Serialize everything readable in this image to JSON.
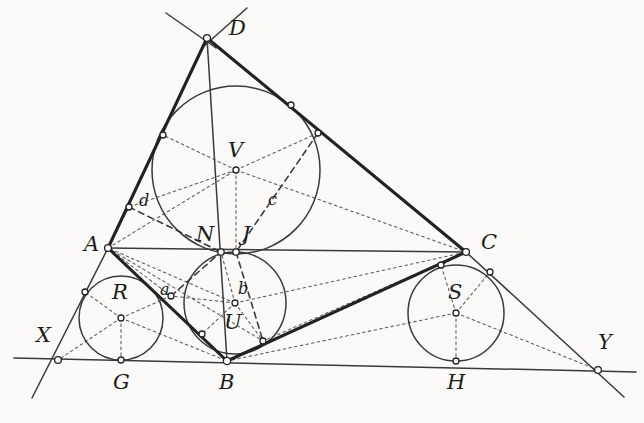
{
  "figure": {
    "kind": "euclidean-geometry-diagram",
    "background_color": "#fbfaf8",
    "stroke_color": "#2b2b2b",
    "solid_line_color": "#3a3a3a",
    "heavy_line_color": "#262626",
    "dashed_line_color": "#555555",
    "node_fill": "#ffffff",
    "canvas": {
      "width": 644,
      "height": 423
    }
  },
  "labels": {
    "capitals": [
      {
        "id": "D",
        "text": "D",
        "x": 229,
        "y": 18
      },
      {
        "id": "V",
        "text": "V",
        "x": 228,
        "y": 140
      },
      {
        "id": "A",
        "text": "A",
        "x": 84,
        "y": 234
      },
      {
        "id": "C",
        "text": "C",
        "x": 481,
        "y": 232
      },
      {
        "id": "N",
        "text": "N",
        "x": 196,
        "y": 224
      },
      {
        "id": "J",
        "text": "J",
        "x": 242,
        "y": 224
      },
      {
        "id": "R",
        "text": "R",
        "x": 112,
        "y": 282
      },
      {
        "id": "S",
        "text": "S",
        "x": 448,
        "y": 282
      },
      {
        "id": "U",
        "text": "U",
        "x": 224,
        "y": 312
      },
      {
        "id": "X",
        "text": "X",
        "x": 36,
        "y": 325
      },
      {
        "id": "Y",
        "text": "Y",
        "x": 598,
        "y": 332
      },
      {
        "id": "G",
        "text": "G",
        "x": 113,
        "y": 372
      },
      {
        "id": "B",
        "text": "B",
        "x": 219,
        "y": 372
      },
      {
        "id": "H",
        "text": "H",
        "x": 447,
        "y": 372
      }
    ],
    "lowercase": [
      {
        "id": "d",
        "text": "d",
        "x": 139,
        "y": 193
      },
      {
        "id": "c",
        "text": "c",
        "x": 268,
        "y": 192
      },
      {
        "id": "a",
        "text": "a",
        "x": 160,
        "y": 282
      },
      {
        "id": "b",
        "text": "b",
        "x": 238,
        "y": 281
      }
    ]
  },
  "points": {
    "D": {
      "x": 207,
      "y": 38
    },
    "A": {
      "x": 108,
      "y": 248
    },
    "B": {
      "x": 227,
      "y": 361
    },
    "C": {
      "x": 466,
      "y": 252
    },
    "X": {
      "x": 58,
      "y": 360
    },
    "Y": {
      "x": 598,
      "y": 370
    },
    "N": {
      "x": 221,
      "y": 252
    },
    "J": {
      "x": 236,
      "y": 252
    },
    "V": {
      "x": 236,
      "y": 170
    },
    "U": {
      "x": 235,
      "y": 303
    },
    "R": {
      "x": 121,
      "y": 318
    },
    "S": {
      "x": 456,
      "y": 313
    },
    "G": {
      "x": 121,
      "y": 360
    },
    "H": {
      "x": 456,
      "y": 361
    }
  },
  "circles": [
    {
      "id": "circle-V",
      "center_label": "V",
      "cx": 236,
      "cy": 170,
      "r": 84
    },
    {
      "id": "circle-U",
      "center_label": "U",
      "cx": 235,
      "cy": 303,
      "r": 51
    },
    {
      "id": "circle-R",
      "center_label": "R",
      "cx": 121,
      "cy": 318,
      "r": 42
    },
    {
      "id": "circle-S",
      "center_label": "S",
      "cx": 456,
      "cy": 313,
      "r": 48
    }
  ],
  "tangency_nodes": [
    {
      "id": "node-D",
      "x": 207,
      "y": 38
    },
    {
      "id": "node-AD-V",
      "x": 163,
      "y": 135
    },
    {
      "id": "node-DC-V",
      "x": 291,
      "y": 105
    },
    {
      "id": "node-DC-V2",
      "x": 318,
      "y": 133
    },
    {
      "id": "node-d",
      "x": 129,
      "y": 207
    },
    {
      "id": "node-A",
      "x": 108,
      "y": 248
    },
    {
      "id": "node-N",
      "x": 221,
      "y": 252
    },
    {
      "id": "node-J",
      "x": 236,
      "y": 252
    },
    {
      "id": "node-C",
      "x": 466,
      "y": 252
    },
    {
      "id": "node-V",
      "x": 236,
      "y": 170
    },
    {
      "id": "node-CS-1",
      "x": 441,
      "y": 265
    },
    {
      "id": "node-CS-2",
      "x": 490,
      "y": 272
    },
    {
      "id": "node-XA",
      "x": 85,
      "y": 292
    },
    {
      "id": "node-a",
      "x": 171,
      "y": 296
    },
    {
      "id": "node-R",
      "x": 121,
      "y": 318
    },
    {
      "id": "node-U",
      "x": 235,
      "y": 303
    },
    {
      "id": "node-S",
      "x": 456,
      "y": 313
    },
    {
      "id": "node-BU-1",
      "x": 202,
      "y": 334
    },
    {
      "id": "node-BU-2",
      "x": 263,
      "y": 341
    },
    {
      "id": "node-X",
      "x": 58,
      "y": 360
    },
    {
      "id": "node-G",
      "x": 121,
      "y": 360
    },
    {
      "id": "node-B",
      "x": 227,
      "y": 361
    },
    {
      "id": "node-H",
      "x": 456,
      "y": 361
    },
    {
      "id": "node-Y",
      "x": 598,
      "y": 370
    }
  ]
}
